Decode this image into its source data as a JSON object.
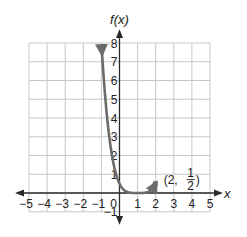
{
  "chart_data": {
    "type": "line",
    "title": "",
    "xlabel": "x",
    "ylabel": "f(x)",
    "xlim": [
      -5,
      5
    ],
    "ylim": [
      -1,
      8
    ],
    "grid": true,
    "x_ticks": [
      "−5",
      "−4",
      "−3",
      "−2",
      "−1",
      "0",
      "1",
      "2",
      "3",
      "4",
      "5"
    ],
    "y_ticks": [
      "−1",
      "1",
      "2",
      "3",
      "4",
      "5",
      "6",
      "7",
      "8"
    ],
    "series": [
      {
        "name": "f(x) = 1/2 (x − 1)^4",
        "x": [
          -1,
          -0.5,
          0,
          0.5,
          1,
          1.5,
          2,
          2.5,
          3
        ],
        "values": [
          8,
          2.53,
          0.5,
          0.03,
          0,
          0.03,
          0.5,
          2.53,
          8
        ],
        "arrows_at_ends": true
      }
    ],
    "annotations": [
      {
        "point": [
          2,
          0.5
        ],
        "label_prefix": "(2, ",
        "frac_num": "1",
        "frac_den": "2",
        "label_suffix": ")"
      }
    ]
  },
  "colors": {
    "grid": "#c6c6c6",
    "axis": "#2a2a2a",
    "curve": "#6b6b6b"
  }
}
